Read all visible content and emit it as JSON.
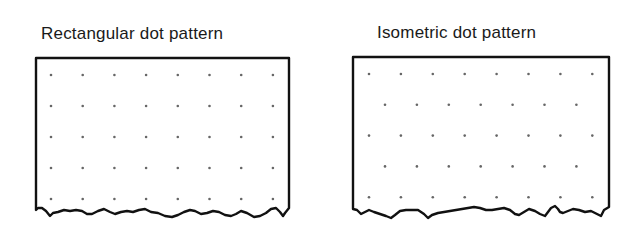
{
  "panels": [
    {
      "title": "Rectangular dot pattern",
      "pattern": "rectangular",
      "columns": 8,
      "rows": 5
    },
    {
      "title": "Isometric dot pattern",
      "pattern": "isometric",
      "rows": 5,
      "dots_per_row": [
        8,
        7,
        8,
        7,
        8
      ]
    }
  ],
  "colors": {
    "outline": "#111111",
    "dot": "#666666"
  }
}
